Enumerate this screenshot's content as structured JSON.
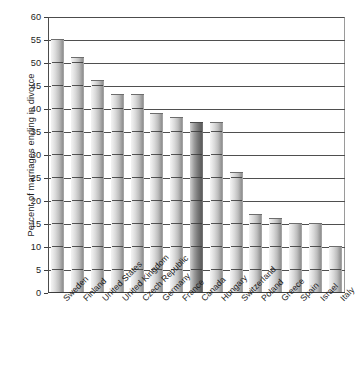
{
  "chart_data": {
    "type": "bar",
    "title": "",
    "xlabel": "",
    "ylabel": "Percent of marriages ending in divorce",
    "ylim": [
      0,
      60
    ],
    "ytick_step": 5,
    "grid": "horizontal",
    "legend": "none",
    "highlighted_category": "Canada",
    "categories": [
      "Sweden",
      "Finland",
      "United States",
      "United Kingdom",
      "Czech Republic",
      "Germany",
      "France",
      "Canada",
      "Hungary",
      "Switzerland",
      "Poland",
      "Greece",
      "Spain",
      "Israel",
      "Italy"
    ],
    "values": [
      55,
      51,
      46,
      43,
      43,
      39,
      38,
      37,
      37,
      26,
      17,
      16,
      15,
      15,
      10
    ],
    "ytick_labels": [
      "0",
      "5",
      "10",
      "15",
      "20",
      "25",
      "30",
      "35",
      "40",
      "45",
      "50",
      "55",
      "60"
    ],
    "ytick_values": [
      0,
      5,
      10,
      15,
      20,
      25,
      30,
      35,
      40,
      45,
      50,
      55,
      60
    ]
  },
  "colors": {
    "bar_light": "#f3f3f3",
    "bar_dark": "#8d8d8d",
    "bar_highlight_dark": "#5c5c5c",
    "axis": "#3d3d3d",
    "gridline": "#4f4f4f",
    "text": "#1d1d1d",
    "background": "#ffffff"
  }
}
